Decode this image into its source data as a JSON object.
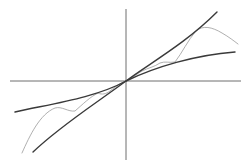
{
  "diagram": {
    "title": "",
    "origin": [
      126,
      81
    ],
    "axes": {
      "x_axis": {
        "from": [
          10,
          81
        ],
        "to": [
          241,
          81
        ]
      },
      "y_axis": {
        "from": [
          126,
          9
        ],
        "to": [
          126,
          160
        ]
      }
    },
    "curves": [
      {
        "name": "steep-curve",
        "style": "dark",
        "color": "#3a3a3a",
        "path": "M33,152 C60,126 95,104 126,81 C150,63 185,44 217,12"
      },
      {
        "name": "flat-curve",
        "style": "dark",
        "color": "#3a3a3a",
        "path": "M15,112 C50,104 95,98 126,81 C155,67 195,55 235,52"
      },
      {
        "name": "oscillating-curve",
        "style": "light",
        "color": "#9a9a9a",
        "path": "M22,153 C30,135 40,114 55,108 C62,106 68,112 75,111 C83,104 90,97 98,93 C102,95 106,94 110,91 C116,86 121,83 126,81 C132,78 137,74 142,71 C148,68 154,67 160,63 C165,61 169,63 175,62 C182,53 188,40 196,31 C203,25 212,27 222,33 C229,37 234,41 238,44"
      }
    ],
    "labels": []
  }
}
